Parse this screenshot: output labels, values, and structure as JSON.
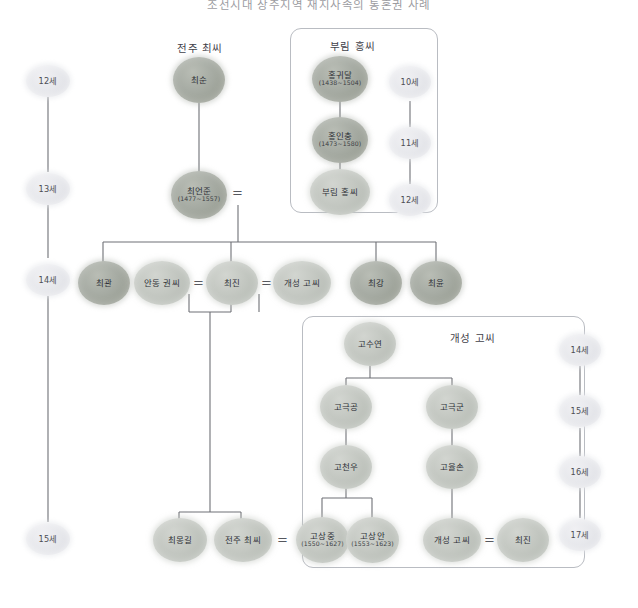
{
  "title": {
    "text": "조선시대 상주지역 재지사족의 통혼권 사례"
  },
  "colors": {
    "line": "#6e7076",
    "box_border": "#b9bcc2",
    "node_dark": "#a7aca4",
    "node_mid": "#c3c7c1",
    "node_light": "#e2e3e6",
    "text": "#2f3138"
  },
  "generation_axis_left": {
    "name": "left-generation-axis",
    "items": [
      {
        "label": "12세"
      },
      {
        "label": "13세"
      },
      {
        "label": "14세"
      },
      {
        "label": "15세"
      }
    ]
  },
  "generation_axis_hong": {
    "name": "hong-generation-axis",
    "items": [
      {
        "label": "10세"
      },
      {
        "label": "11세"
      },
      {
        "label": "12세"
      }
    ]
  },
  "generation_axis_right": {
    "name": "go-generation-axis",
    "items": [
      {
        "label": "14세"
      },
      {
        "label": "15세"
      },
      {
        "label": "16세"
      },
      {
        "label": "17세"
      }
    ]
  },
  "clans": {
    "choi_label": "전주 최씨",
    "hong_label": "부림 홍씨",
    "go_label": "개성 고씨"
  },
  "people": {
    "choi_sun": {
      "name": "최순",
      "years": ""
    },
    "choi_eonjun": {
      "name": "최언준",
      "years": "(1477~1557)"
    },
    "hong_gwidal": {
      "name": "홍귀달",
      "years": "(1438~1504)"
    },
    "hong_inchung": {
      "name": "홍인충",
      "years": "(1473~1580)"
    },
    "hong_clan_wife": {
      "name": "부림 홍씨",
      "years": ""
    },
    "choi_gwan": {
      "name": "최관",
      "years": ""
    },
    "andong_gwon": {
      "name": "안동 권씨",
      "years": ""
    },
    "choi_jin": {
      "name": "최진",
      "years": ""
    },
    "gaeseong_go": {
      "name": "개성 고씨",
      "years": ""
    },
    "choi_gang": {
      "name": "최강",
      "years": ""
    },
    "choi_yun": {
      "name": "최윤",
      "years": ""
    },
    "go_suyeon": {
      "name": "고수연",
      "years": ""
    },
    "go_geukgong": {
      "name": "고극공",
      "years": ""
    },
    "go_geukgun": {
      "name": "고극군",
      "years": ""
    },
    "go_cheonu": {
      "name": "고천우",
      "years": ""
    },
    "go_yulson": {
      "name": "고율손",
      "years": ""
    },
    "go_sangjung": {
      "name": "고상중",
      "years": "(1550~1627)"
    },
    "go_sangan": {
      "name": "고상안",
      "years": "(1553~1623)"
    },
    "choi_monggil": {
      "name": "최몽길",
      "years": ""
    },
    "jeonju_choi_wife": {
      "name": "전주 최씨",
      "years": ""
    },
    "gaeseong_go_bottom": {
      "name": "개성 고씨",
      "years": ""
    },
    "choi_jin_bottom": {
      "name": "최진",
      "years": ""
    }
  },
  "marriages": [
    {
      "name": "marriage-choi-eonjun-hong",
      "symbol": "="
    },
    {
      "name": "marriage-gwon-choi-jin",
      "symbol": "="
    },
    {
      "name": "marriage-choi-jin-go",
      "symbol": "="
    },
    {
      "name": "marriage-jeonju-choi-go",
      "symbol": "="
    },
    {
      "name": "marriage-go-choi-jin",
      "symbol": "="
    }
  ]
}
